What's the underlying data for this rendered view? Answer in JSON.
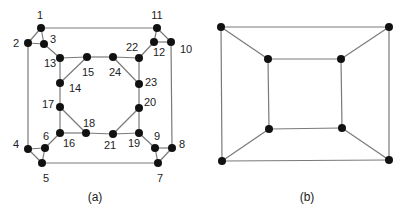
{
  "figure": {
    "graph_a": {
      "caption": "(a)",
      "caption_pos": [
        95,
        201
      ],
      "nodes": [
        {
          "id": "1",
          "x": 41,
          "y": 28,
          "lx": 40,
          "ly": 19
        },
        {
          "id": "2",
          "x": 28,
          "y": 43,
          "lx": 16,
          "ly": 47
        },
        {
          "id": "3",
          "x": 44,
          "y": 44,
          "lx": 53,
          "ly": 43
        },
        {
          "id": "4",
          "x": 28,
          "y": 149,
          "lx": 16,
          "ly": 148
        },
        {
          "id": "5",
          "x": 42,
          "y": 163,
          "lx": 46,
          "ly": 182
        },
        {
          "id": "6",
          "x": 45,
          "y": 148,
          "lx": 46,
          "ly": 140
        },
        {
          "id": "7",
          "x": 158,
          "y": 163,
          "lx": 160,
          "ly": 182
        },
        {
          "id": "8",
          "x": 172,
          "y": 148,
          "lx": 182,
          "ly": 148
        },
        {
          "id": "9",
          "x": 155,
          "y": 148,
          "lx": 157,
          "ly": 140
        },
        {
          "id": "10",
          "x": 171,
          "y": 42,
          "lx": 186,
          "ly": 53
        },
        {
          "id": "11",
          "x": 157,
          "y": 28,
          "lx": 157,
          "ly": 19
        },
        {
          "id": "12",
          "x": 154,
          "y": 42,
          "lx": 159,
          "ly": 56
        },
        {
          "id": "13",
          "x": 60,
          "y": 58,
          "lx": 50,
          "ly": 67
        },
        {
          "id": "14",
          "x": 60,
          "y": 83,
          "lx": 75,
          "ly": 92
        },
        {
          "id": "15",
          "x": 87,
          "y": 57,
          "lx": 88,
          "ly": 76
        },
        {
          "id": "16",
          "x": 60,
          "y": 133,
          "lx": 69,
          "ly": 147
        },
        {
          "id": "17",
          "x": 60,
          "y": 107,
          "lx": 48,
          "ly": 108
        },
        {
          "id": "18",
          "x": 86,
          "y": 133,
          "lx": 89,
          "ly": 127
        },
        {
          "id": "19",
          "x": 139,
          "y": 133,
          "lx": 134,
          "ly": 147
        },
        {
          "id": "20",
          "x": 139,
          "y": 108,
          "lx": 150,
          "ly": 106
        },
        {
          "id": "21",
          "x": 113,
          "y": 134,
          "lx": 110,
          "ly": 149
        },
        {
          "id": "22",
          "x": 139,
          "y": 58,
          "lx": 132,
          "ly": 51
        },
        {
          "id": "23",
          "x": 139,
          "y": 84,
          "lx": 151,
          "ly": 86
        },
        {
          "id": "24",
          "x": 113,
          "y": 57,
          "lx": 115,
          "ly": 76
        }
      ],
      "edges": [
        [
          "1",
          "11"
        ],
        [
          "1",
          "2"
        ],
        [
          "1",
          "3"
        ],
        [
          "2",
          "3"
        ],
        [
          "2",
          "4"
        ],
        [
          "3",
          "13"
        ],
        [
          "11",
          "12"
        ],
        [
          "11",
          "10"
        ],
        [
          "12",
          "10"
        ],
        [
          "10",
          "8"
        ],
        [
          "12",
          "22"
        ],
        [
          "4",
          "6"
        ],
        [
          "4",
          "5"
        ],
        [
          "6",
          "5"
        ],
        [
          "5",
          "7"
        ],
        [
          "6",
          "16"
        ],
        [
          "7",
          "9"
        ],
        [
          "7",
          "8"
        ],
        [
          "9",
          "8"
        ],
        [
          "9",
          "19"
        ],
        [
          "13",
          "15"
        ],
        [
          "15",
          "24"
        ],
        [
          "24",
          "22"
        ],
        [
          "13",
          "14"
        ],
        [
          "15",
          "14"
        ],
        [
          "24",
          "23"
        ],
        [
          "22",
          "23"
        ],
        [
          "14",
          "17"
        ],
        [
          "23",
          "20"
        ],
        [
          "17",
          "16"
        ],
        [
          "17",
          "18"
        ],
        [
          "16",
          "18"
        ],
        [
          "18",
          "21"
        ],
        [
          "21",
          "19"
        ],
        [
          "21",
          "20"
        ],
        [
          "20",
          "19"
        ]
      ]
    },
    "graph_b": {
      "caption": "(b)",
      "caption_pos": [
        307,
        201
      ],
      "nodes": [
        {
          "id": "o1",
          "x": 221,
          "y": 27
        },
        {
          "id": "o2",
          "x": 389,
          "y": 27
        },
        {
          "id": "o3",
          "x": 389,
          "y": 160
        },
        {
          "id": "o4",
          "x": 222,
          "y": 161
        },
        {
          "id": "i1",
          "x": 268,
          "y": 59
        },
        {
          "id": "i2",
          "x": 341,
          "y": 59
        },
        {
          "id": "i3",
          "x": 342,
          "y": 128
        },
        {
          "id": "i4",
          "x": 269,
          "y": 129
        }
      ],
      "edges": [
        [
          "o1",
          "o2"
        ],
        [
          "o2",
          "o3"
        ],
        [
          "o3",
          "o4"
        ],
        [
          "o4",
          "o1"
        ],
        [
          "i1",
          "i2"
        ],
        [
          "i2",
          "i3"
        ],
        [
          "i3",
          "i4"
        ],
        [
          "i4",
          "i1"
        ],
        [
          "o1",
          "i1"
        ],
        [
          "o2",
          "i2"
        ],
        [
          "o3",
          "i3"
        ],
        [
          "o4",
          "i4"
        ]
      ]
    }
  }
}
